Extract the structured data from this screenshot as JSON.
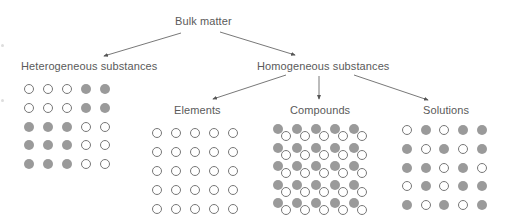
{
  "nodes": {
    "root": "Bulk matter",
    "heterogeneous": "Heterogeneous substances",
    "homogeneous": "Homogeneous substances",
    "elements": "Elements",
    "compounds": "Compounds",
    "solutions": "Solutions"
  },
  "colors": {
    "filled_particle": "#9a9a9a",
    "open_particle_stroke": "#777777",
    "arrow": "#555555",
    "text": "#5a5a5a"
  },
  "grids": {
    "heterogeneous": [
      [
        "open",
        "open",
        "open",
        "filled",
        "filled"
      ],
      [
        "open",
        "open",
        "open",
        "filled",
        "filled"
      ],
      [
        "filled",
        "filled",
        "filled",
        "open",
        "open"
      ],
      [
        "filled",
        "filled",
        "filled",
        "open",
        "open"
      ],
      [
        "filled",
        "filled",
        "filled",
        "open",
        "open"
      ]
    ],
    "elements": [
      [
        "open",
        "open",
        "open",
        "open",
        "open"
      ],
      [
        "open",
        "open",
        "open",
        "open",
        "open"
      ],
      [
        "open",
        "open",
        "open",
        "open",
        "open"
      ],
      [
        "open",
        "open",
        "open",
        "open",
        "open"
      ],
      [
        "open",
        "open",
        "open",
        "open",
        "open"
      ]
    ],
    "compounds": [
      [
        "pair",
        "pair",
        "pair",
        "pair",
        "pair"
      ],
      [
        "pair",
        "pair",
        "pair",
        "pair",
        "pair"
      ],
      [
        "pair",
        "pair",
        "pair",
        "pair",
        "pair"
      ],
      [
        "pair",
        "pair",
        "pair",
        "pair",
        "pair"
      ],
      [
        "pair",
        "pair",
        "pair",
        "pair",
        "pair"
      ]
    ],
    "solutions": [
      [
        "open",
        "filled",
        "open",
        "filled",
        "filled"
      ],
      [
        "filled",
        "open",
        "filled",
        "open",
        "filled"
      ],
      [
        "filled",
        "filled",
        "open",
        "filled",
        "open"
      ],
      [
        "open",
        "filled",
        "open",
        "filled",
        "filled"
      ],
      [
        "filled",
        "open",
        "filled",
        "open",
        "filled"
      ]
    ]
  }
}
